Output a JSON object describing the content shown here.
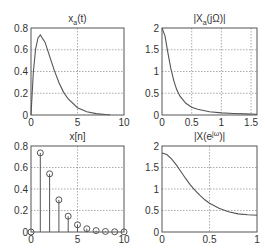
{
  "figure": {
    "width": 265,
    "height": 250,
    "line_color": "#555555",
    "grid_color": "#888888"
  },
  "chart_data": [
    {
      "id": "xa_t",
      "type": "line",
      "title": "x_a(t)",
      "title_main": "x",
      "title_sub": "a",
      "title_rest": "(t)",
      "xlabel": "",
      "ylabel": "",
      "xlim": [
        0,
        10
      ],
      "ylim": [
        0,
        0.8
      ],
      "xticks": [
        0,
        5,
        10
      ],
      "xtick_labels": [
        "0",
        "5",
        "10"
      ],
      "yticks": [
        0,
        0.2,
        0.4,
        0.6,
        0.8
      ],
      "ytick_labels": [
        "0",
        "0.2",
        "0.4",
        "0.6",
        "0.8"
      ],
      "grid": true,
      "x": [
        0,
        0.25,
        0.5,
        0.75,
        1,
        1.5,
        2,
        2.5,
        3,
        3.5,
        4,
        5,
        6,
        7,
        8,
        8.5
      ],
      "y": [
        0,
        0.389,
        0.607,
        0.708,
        0.736,
        0.669,
        0.541,
        0.41,
        0.299,
        0.211,
        0.147,
        0.067,
        0.03,
        0.013,
        0.005,
        0.003
      ]
    },
    {
      "id": "Xa_jOmega",
      "type": "line",
      "title": "|X_a(jΩ)|",
      "title_main": "|X",
      "title_sub": "a",
      "title_rest": "(jΩ)|",
      "xlabel": "",
      "ylabel": "",
      "xlim": [
        0,
        1.6
      ],
      "ylim": [
        0,
        2
      ],
      "xticks": [
        0,
        0.5,
        1,
        1.5
      ],
      "xtick_labels": [
        "0",
        "0.5",
        "1",
        "1.5"
      ],
      "yticks": [
        0,
        0.5,
        1,
        1.5,
        2
      ],
      "ytick_labels": [
        "0",
        "0.5",
        "1",
        "1.5",
        "2"
      ],
      "grid": true,
      "x": [
        0,
        0.05,
        0.1,
        0.15,
        0.2,
        0.25,
        0.3,
        0.4,
        0.5,
        0.6,
        0.8,
        1.0,
        1.2,
        1.4,
        1.6
      ],
      "y": [
        2.0,
        1.82,
        1.43,
        1.06,
        0.78,
        0.58,
        0.44,
        0.27,
        0.18,
        0.13,
        0.075,
        0.049,
        0.034,
        0.025,
        0.019
      ]
    },
    {
      "id": "x_n",
      "type": "stem",
      "title": "x[n]",
      "title_main": "x[n]",
      "title_sub": "",
      "title_rest": "",
      "xlabel": "",
      "ylabel": "",
      "xlim": [
        0,
        10
      ],
      "ylim": [
        0,
        0.8
      ],
      "xticks": [
        0,
        5,
        10
      ],
      "xtick_labels": [
        "0",
        "5",
        "10"
      ],
      "yticks": [
        0,
        0.2,
        0.4,
        0.6,
        0.8
      ],
      "ytick_labels": [
        "0",
        "0.2",
        "0.4",
        "0.6",
        "0.8"
      ],
      "grid": true,
      "x": [
        0,
        1,
        2,
        3,
        4,
        5,
        6,
        7,
        8,
        9,
        10
      ],
      "y": [
        0,
        0.736,
        0.541,
        0.299,
        0.147,
        0.067,
        0.03,
        0.013,
        0.005,
        0.002,
        0.001
      ]
    },
    {
      "id": "X_ejw",
      "type": "line",
      "title": "|X(e^{jω})|",
      "title_main": "|X(e",
      "title_sup": "jω",
      "title_rest": ")|",
      "xlabel": "",
      "ylabel": "",
      "xlim": [
        0,
        1
      ],
      "ylim": [
        0,
        2
      ],
      "xticks": [
        0,
        0.5,
        1
      ],
      "xtick_labels": [
        "0",
        "0.5",
        "1"
      ],
      "yticks": [
        0,
        0.5,
        1,
        1.5,
        2
      ],
      "ytick_labels": [
        "0",
        "0.5",
        "1",
        "1.5",
        "2"
      ],
      "grid": true,
      "x": [
        0,
        0.05,
        0.1,
        0.15,
        0.2,
        0.25,
        0.3,
        0.35,
        0.4,
        0.45,
        0.5,
        0.6,
        0.7,
        0.8,
        0.9,
        1.0
      ],
      "y": [
        1.84,
        1.8,
        1.7,
        1.56,
        1.4,
        1.24,
        1.09,
        0.96,
        0.85,
        0.75,
        0.67,
        0.55,
        0.47,
        0.42,
        0.4,
        0.39
      ]
    }
  ]
}
